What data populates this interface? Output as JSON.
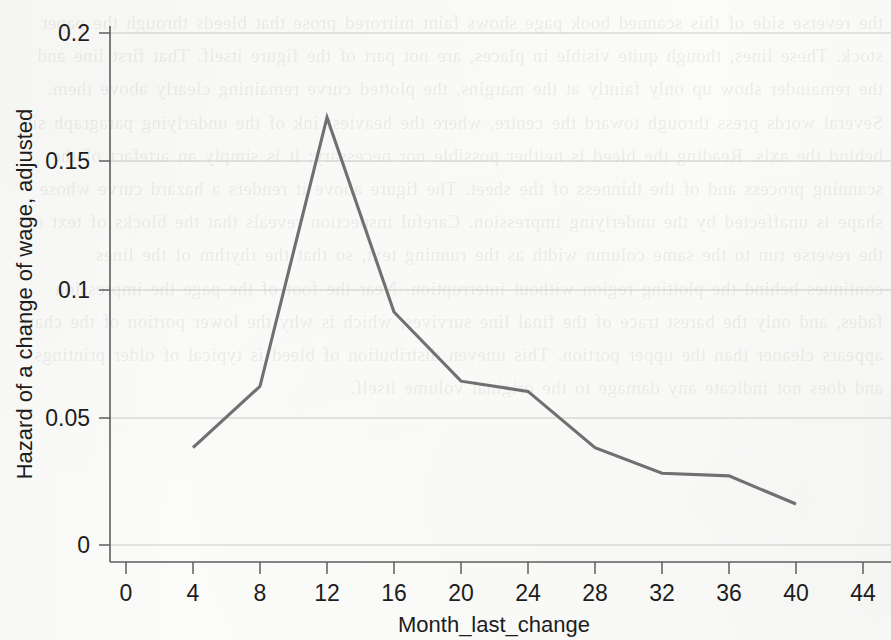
{
  "chart_data": {
    "type": "line",
    "title": "",
    "xlabel": "Month_last_change",
    "ylabel": "Hazard of a change of wage, adjusted",
    "x": [
      4,
      8,
      12,
      16,
      20,
      24,
      28,
      32,
      36,
      40
    ],
    "values": [
      0.038,
      0.062,
      0.167,
      0.091,
      0.064,
      0.06,
      0.038,
      0.028,
      0.027,
      0.016
    ],
    "series": [
      {
        "name": "Hazard of a change of wage, adjusted",
        "values": [
          0.038,
          0.062,
          0.167,
          0.091,
          0.064,
          0.06,
          0.038,
          0.028,
          0.027,
          0.016
        ]
      }
    ],
    "xlim": [
      -2,
      46
    ],
    "ylim": [
      0,
      0.215
    ],
    "xticks": [
      0,
      4,
      8,
      12,
      16,
      20,
      24,
      28,
      32,
      36,
      40,
      44
    ],
    "xtick_labels": [
      "0",
      "4",
      "8",
      "12",
      "16",
      "20",
      "24",
      "28",
      "32",
      "36",
      "40",
      "44"
    ],
    "yticks": [
      0,
      0.05,
      0.1,
      0.15,
      0.2
    ],
    "ytick_labels": [
      "0",
      "0.05",
      "0.1",
      "0.15",
      "0.2"
    ],
    "grid": "horizontal",
    "legend": "none",
    "line_color": "#707070",
    "grid_color": "#c9c9c6",
    "axis_color": "#5e5e5e",
    "background_color": "#fbfbfa"
  },
  "artifact": {
    "bleed_text": "page bleed-through from reverse side of scanned book page, illegible mirrored serif body text occupying the full page behind the figure, approximately fifteen lines of justified prose arranged in a single column"
  }
}
